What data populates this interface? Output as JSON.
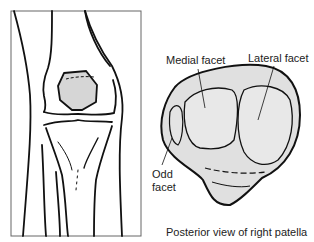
{
  "figure": {
    "left_panel": {
      "subject": "anterior view of knee joint",
      "highlighted_bone": "patella"
    },
    "right_panel": {
      "subject": "patella",
      "labels": {
        "medial_facet": "Medial facet",
        "lateral_facet": "Lateral facet",
        "odd_facet_line1": "Odd",
        "odd_facet_line2": "facet"
      },
      "caption": "Posterior view of right patella"
    },
    "colors": {
      "line": "#111111",
      "patella_fill": "#d6d6d6",
      "facet_fill": "#e4e4e4",
      "frame": "#555555"
    }
  }
}
